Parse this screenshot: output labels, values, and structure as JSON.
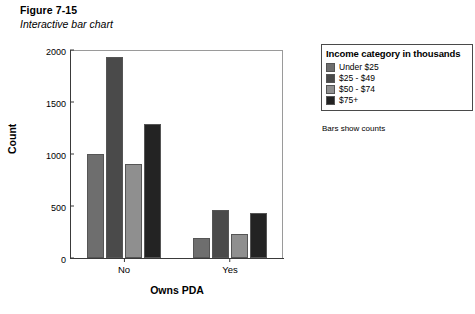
{
  "figure": {
    "number": "Figure 7-15",
    "title": "Interactive bar chart"
  },
  "legend": {
    "title": "Income category in thousands",
    "footnote": "Bars show counts",
    "items": [
      {
        "label": "Under $25",
        "color": "#6e6e6e"
      },
      {
        "label": "$25 - $49",
        "color": "#4a4a4a"
      },
      {
        "label": "$50 - $74",
        "color": "#8f8f8f"
      },
      {
        "label": "$75+",
        "color": "#232323"
      }
    ]
  },
  "chart_data": {
    "type": "bar",
    "title": "Interactive bar chart",
    "xlabel": "Owns PDA",
    "ylabel": "Count",
    "categories": [
      "No",
      "Yes"
    ],
    "ylim": [
      0,
      2000
    ],
    "yticks": [
      0,
      500,
      1000,
      1500,
      2000
    ],
    "ytick_labels": [
      "0",
      "500",
      "1000",
      "1500",
      "2000"
    ],
    "grid": false,
    "legend_position": "right-outside",
    "legend_title": "Income category in thousands",
    "annotations": [
      "Bars show counts"
    ],
    "series": [
      {
        "name": "Under $25",
        "color": "#6e6e6e",
        "values": [
          1000,
          190
        ]
      },
      {
        "name": "$25 - $49",
        "color": "#4a4a4a",
        "values": [
          1930,
          460
        ]
      },
      {
        "name": "$50 - $74",
        "color": "#8f8f8f",
        "values": [
          900,
          230
        ]
      },
      {
        "name": "$75+",
        "color": "#232323",
        "values": [
          1290,
          430
        ]
      }
    ]
  }
}
